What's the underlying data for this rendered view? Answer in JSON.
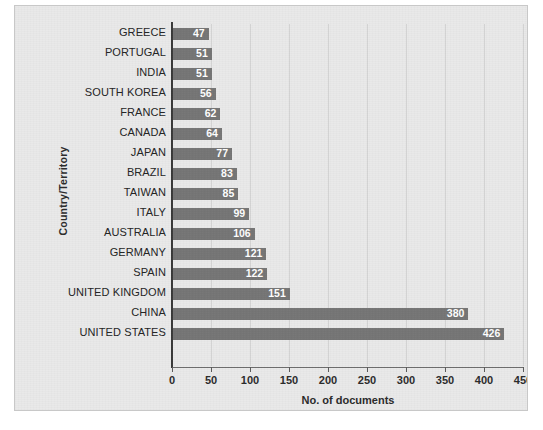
{
  "chart_data": {
    "type": "bar",
    "orientation": "horizontal",
    "title": "",
    "xlabel": "No. of documents",
    "ylabel": "Country/Territory",
    "xlim": [
      0,
      450
    ],
    "xticks": [
      0,
      50,
      100,
      150,
      200,
      250,
      300,
      350,
      400,
      450
    ],
    "grid": true,
    "legend": false,
    "bar_color": "#757575",
    "value_label_color": "#ffffff",
    "background_color": "#e9e9e9",
    "categories": [
      "GREECE",
      "PORTUGAL",
      "INDIA",
      "SOUTH KOREA",
      "FRANCE",
      "CANADA",
      "JAPAN",
      "BRAZIL",
      "TAIWAN",
      "ITALY",
      "AUSTRALIA",
      "GERMANY",
      "SPAIN",
      "UNITED KINGDOM",
      "CHINA",
      "UNITED STATES"
    ],
    "values": [
      47,
      51,
      51,
      56,
      62,
      64,
      77,
      83,
      85,
      99,
      106,
      121,
      122,
      151,
      380,
      426
    ]
  }
}
